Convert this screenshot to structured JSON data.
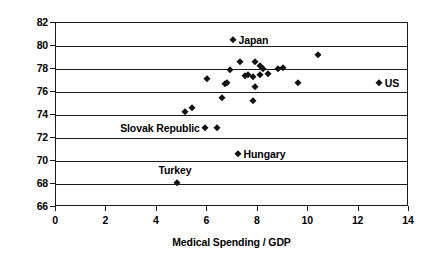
{
  "chart_data": {
    "type": "scatter",
    "title": "",
    "xlabel": "Medical Spending / GDP",
    "ylabel": "Life Expectancy at Birth",
    "xlim": [
      0,
      14
    ],
    "ylim": [
      66,
      82
    ],
    "xticks": [
      0,
      2,
      4,
      6,
      8,
      10,
      12,
      14
    ],
    "yticks": [
      66,
      68,
      70,
      72,
      74,
      76,
      78,
      80,
      82
    ],
    "grid": "horizontal",
    "legend": "none",
    "marker": "diamond",
    "marker_color": "#111111",
    "points": [
      {
        "x": 7.0,
        "y": 80.5,
        "label": "Japan",
        "label_pos": "right"
      },
      {
        "x": 12.8,
        "y": 76.8,
        "label": "US",
        "label_pos": "right"
      },
      {
        "x": 7.2,
        "y": 70.6,
        "label": "Hungary",
        "label_pos": "right"
      },
      {
        "x": 4.8,
        "y": 68.1,
        "label": "Turkey",
        "label_pos": "above"
      },
      {
        "x": 5.9,
        "y": 72.9,
        "label": "Slovak Republic",
        "label_pos": "left"
      },
      {
        "x": 6.4,
        "y": 72.9,
        "label": "",
        "label_pos": ""
      },
      {
        "x": 5.1,
        "y": 74.3,
        "label": "",
        "label_pos": ""
      },
      {
        "x": 5.4,
        "y": 74.6,
        "label": "",
        "label_pos": ""
      },
      {
        "x": 6.0,
        "y": 77.1,
        "label": "",
        "label_pos": ""
      },
      {
        "x": 7.3,
        "y": 78.6,
        "label": "",
        "label_pos": ""
      },
      {
        "x": 7.9,
        "y": 78.6,
        "label": "",
        "label_pos": ""
      },
      {
        "x": 6.9,
        "y": 77.9,
        "label": "",
        "label_pos": ""
      },
      {
        "x": 8.1,
        "y": 78.3,
        "label": "",
        "label_pos": ""
      },
      {
        "x": 8.2,
        "y": 78.0,
        "label": "",
        "label_pos": ""
      },
      {
        "x": 8.8,
        "y": 78.0,
        "label": "",
        "label_pos": ""
      },
      {
        "x": 9.0,
        "y": 78.1,
        "label": "",
        "label_pos": ""
      },
      {
        "x": 7.5,
        "y": 77.4,
        "label": "",
        "label_pos": ""
      },
      {
        "x": 7.6,
        "y": 77.5,
        "label": "",
        "label_pos": ""
      },
      {
        "x": 7.8,
        "y": 77.3,
        "label": "",
        "label_pos": ""
      },
      {
        "x": 8.1,
        "y": 77.5,
        "label": "",
        "label_pos": ""
      },
      {
        "x": 8.4,
        "y": 77.6,
        "label": "",
        "label_pos": ""
      },
      {
        "x": 10.4,
        "y": 79.2,
        "label": "",
        "label_pos": ""
      },
      {
        "x": 7.9,
        "y": 76.4,
        "label": "",
        "label_pos": ""
      },
      {
        "x": 9.6,
        "y": 76.8,
        "label": "",
        "label_pos": ""
      },
      {
        "x": 7.8,
        "y": 75.2,
        "label": "",
        "label_pos": ""
      },
      {
        "x": 6.7,
        "y": 76.7,
        "label": "",
        "label_pos": ""
      },
      {
        "x": 6.8,
        "y": 76.8,
        "label": "",
        "label_pos": ""
      },
      {
        "x": 6.6,
        "y": 75.5,
        "label": "",
        "label_pos": ""
      }
    ]
  }
}
